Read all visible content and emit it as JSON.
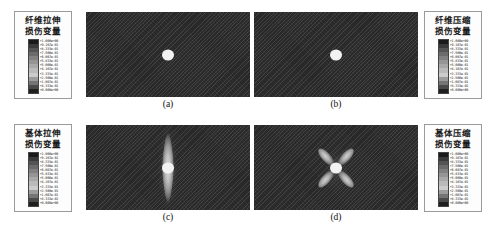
{
  "figure": {
    "layout": "2x2 grid of finite-element damage contour plots with four corner legends",
    "panels": [
      {
        "id": "a",
        "caption": "(a)",
        "damage_mode": "fiber tension",
        "pattern": "none",
        "description": "Uniform undamaged plate with central circular hole"
      },
      {
        "id": "b",
        "caption": "(b)",
        "damage_mode": "fiber compression",
        "pattern": "none",
        "description": "Uniform undamaged plate with central circular hole"
      },
      {
        "id": "c",
        "caption": "(c)",
        "damage_mode": "matrix tension",
        "pattern": "vertical-lens",
        "description": "Vertically elongated lens-shaped damage zone above and below hole"
      },
      {
        "id": "d",
        "caption": "(d)",
        "damage_mode": "matrix compression",
        "pattern": "four-lobe-butterfly",
        "description": "Four diagonal lobes radiating from hole in butterfly pattern"
      }
    ],
    "legends": [
      {
        "id": "fiber-tension",
        "position": "top-left",
        "title_line1": "纤维拉伸",
        "title_line2": "损伤变量",
        "ticks": [
          "+1.000e+00",
          "+9.167e-01",
          "+8.333e-01",
          "+7.500e-01",
          "+6.667e-01",
          "+5.833e-01",
          "+5.000e-01",
          "+4.167e-01",
          "+3.333e-01",
          "+2.500e-01",
          "+1.667e-01",
          "+8.333e-02",
          "+0.000e+00"
        ]
      },
      {
        "id": "fiber-compression",
        "position": "top-right",
        "title_line1": "纤维压缩",
        "title_line2": "损伤变量",
        "ticks": [
          "+1.000e+00",
          "+9.167e-01",
          "+8.333e-01",
          "+7.500e-01",
          "+6.667e-01",
          "+5.833e-01",
          "+5.000e-01",
          "+4.167e-01",
          "+3.333e-01",
          "+2.500e-01",
          "+1.667e-01",
          "+8.333e-02",
          "+0.000e+00"
        ]
      },
      {
        "id": "matrix-tension",
        "position": "bottom-left",
        "title_line1": "基体拉伸",
        "title_line2": "损伤变量",
        "ticks": [
          "+1.000e+00",
          "+9.167e-01",
          "+8.333e-01",
          "+7.500e-01",
          "+6.667e-01",
          "+5.833e-01",
          "+5.000e-01",
          "+4.167e-01",
          "+3.333e-01",
          "+2.500e-01",
          "+1.667e-01",
          "+8.333e-02",
          "+0.000e+00"
        ]
      },
      {
        "id": "matrix-compression",
        "position": "bottom-right",
        "title_line1": "基体压缩",
        "title_line2": "损伤变量",
        "ticks": [
          "+1.000e+00",
          "+9.167e-01",
          "+8.333e-01",
          "+7.500e-01",
          "+6.667e-01",
          "+5.833e-01",
          "+5.000e-01",
          "+4.167e-01",
          "+3.333e-01",
          "+2.500e-01",
          "+1.667e-01",
          "+8.333e-02",
          "+0.000e+00"
        ]
      }
    ],
    "colorbar_swatches": [
      "#1a1a1a",
      "#3a3a3a",
      "#545454",
      "#6b6b6b",
      "#818181",
      "#959595",
      "#a8a8a8",
      "#bababa",
      "#cbcbcb",
      "#9c9c9c",
      "#757575",
      "#4a4a4a",
      "#1f1f1f"
    ],
    "colors": {
      "mesh_background": "#313131",
      "hole_fill": "#f2f2f2",
      "legend_border": "#9a9a9a",
      "page_background": "#ffffff"
    }
  }
}
